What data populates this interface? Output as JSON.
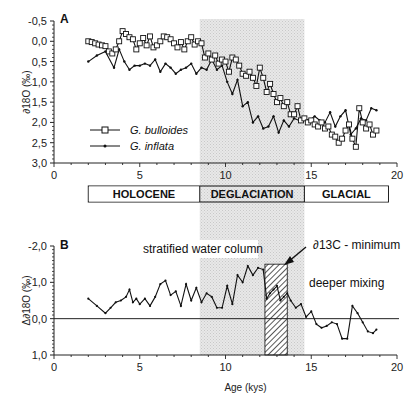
{
  "chart_data": [
    {
      "panel": "A",
      "type": "line",
      "title": "",
      "xlabel": "",
      "ylabel": "∂18O (‰)",
      "xlim": [
        0,
        20
      ],
      "ylim": [
        3.0,
        -0.5
      ],
      "y_inverted": true,
      "x_ticks": [
        "0",
        "5",
        "10",
        "15",
        "20"
      ],
      "y_ticks": [
        "-0,5",
        "0,0",
        "0,5",
        "1,0",
        "1,5",
        "2,0",
        "2,5",
        "3,0"
      ],
      "legend": {
        "position": "lower-left",
        "entries": [
          "G. bulloides",
          "G. inflata"
        ]
      },
      "shaded_region": {
        "x0": 8.5,
        "x1": 14.6,
        "label": "DEGLACIATION"
      },
      "series": [
        {
          "name": "G. bulloides",
          "marker": "open-square",
          "x": [
            2.0,
            2.2,
            2.4,
            2.6,
            2.8,
            3.0,
            3.2,
            3.4,
            3.6,
            3.8,
            4.0,
            4.2,
            4.4,
            4.6,
            4.8,
            5.0,
            5.2,
            5.4,
            5.6,
            5.8,
            6.0,
            6.2,
            6.4,
            6.6,
            6.8,
            7.0,
            7.2,
            7.4,
            7.6,
            7.8,
            8.0,
            8.2,
            8.4,
            8.6,
            8.8,
            9.0,
            9.2,
            9.4,
            9.6,
            9.8,
            10.0,
            10.2,
            10.4,
            10.6,
            10.8,
            11.0,
            11.2,
            11.4,
            11.6,
            11.8,
            12.0,
            12.2,
            12.4,
            12.6,
            12.8,
            13.0,
            13.2,
            13.4,
            13.6,
            13.8,
            14.0,
            14.2,
            14.4,
            14.6,
            14.8,
            15.0,
            15.2,
            15.4,
            15.6,
            15.8,
            16.0,
            16.2,
            16.4,
            16.6,
            16.8,
            17.0,
            17.2,
            17.4,
            17.6,
            17.8,
            18.0,
            18.2,
            18.4,
            18.6,
            18.8
          ],
          "y": [
            0.0,
            0.02,
            0.05,
            0.08,
            0.1,
            0.12,
            0.25,
            0.3,
            0.2,
            0.0,
            -0.25,
            -0.18,
            -0.1,
            -0.05,
            0.2,
            0.05,
            -0.08,
            0.1,
            -0.12,
            0.15,
            0.1,
            0.0,
            -0.12,
            -0.1,
            -0.05,
            0.05,
            0.15,
            0.02,
            0.2,
            0.0,
            -0.1,
            0.08,
            0.0,
            0.05,
            0.4,
            0.3,
            0.45,
            0.35,
            0.55,
            0.45,
            0.5,
            0.75,
            0.4,
            0.45,
            0.6,
            0.8,
            0.85,
            0.75,
            0.9,
            1.1,
            0.65,
            0.9,
            1.25,
            1.05,
            1.3,
            1.5,
            1.4,
            1.6,
            1.5,
            1.8,
            1.8,
            1.6,
            1.95,
            1.9,
            2.0,
            1.95,
            2.05,
            2.1,
            2.0,
            2.15,
            2.1,
            2.3,
            2.35,
            2.5,
            2.4,
            2.2,
            2.05,
            2.4,
            2.6,
            1.65,
            2.0,
            2.15,
            2.05,
            2.3,
            2.2
          ],
          "note": "values estimated from pixel positions"
        },
        {
          "name": "G. inflata",
          "marker": "small-dot",
          "x": [
            2.0,
            2.5,
            3.0,
            3.5,
            3.8,
            4.1,
            4.4,
            4.7,
            5.0,
            5.3,
            5.6,
            5.9,
            6.2,
            6.5,
            6.8,
            7.1,
            7.4,
            7.7,
            8.0,
            8.3,
            8.6,
            8.9,
            9.2,
            9.5,
            9.8,
            10.1,
            10.4,
            10.7,
            11.0,
            11.3,
            11.6,
            11.9,
            12.2,
            12.5,
            12.8,
            13.1,
            13.4,
            13.7,
            14.0,
            14.3,
            14.6,
            14.9,
            15.2,
            15.5,
            15.8,
            16.1,
            16.4,
            16.7,
            17.0,
            17.3,
            17.6,
            17.9,
            18.2,
            18.5,
            18.8
          ],
          "y": [
            0.5,
            0.35,
            0.25,
            0.65,
            0.2,
            0.5,
            0.7,
            0.6,
            0.6,
            0.55,
            0.6,
            0.45,
            0.75,
            0.55,
            0.65,
            0.8,
            0.7,
            0.65,
            0.55,
            0.8,
            0.65,
            0.7,
            0.45,
            0.7,
            0.6,
            1.0,
            1.3,
            0.95,
            1.6,
            1.5,
            2.0,
            1.85,
            2.15,
            2.1,
            1.85,
            2.25,
            1.95,
            2.1,
            1.9,
            1.95,
            1.9,
            1.95,
            1.85,
            1.95,
            2.0,
            1.75,
            2.1,
            1.85,
            1.7,
            2.3,
            2.15,
            1.9,
            1.95,
            1.65,
            1.7
          ]
        }
      ]
    },
    {
      "panel": "B",
      "type": "line",
      "title": "",
      "xlabel": "Age (kys)",
      "ylabel": "Δ∂18O (‰)",
      "xlim": [
        0,
        20
      ],
      "ylim": [
        1.0,
        -2.0
      ],
      "y_inverted": true,
      "x_ticks": [
        "0",
        "5",
        "10",
        "15",
        "20"
      ],
      "y_ticks": [
        "-2,0",
        "-1,0",
        "0,0",
        "1,0"
      ],
      "zero_line": 0.0,
      "shaded_region": {
        "x0": 8.5,
        "x1": 14.6
      },
      "hatched_region": {
        "x0": 12.3,
        "x1": 13.6,
        "ytop": -1.5,
        "label": "∂13C - minimum"
      },
      "annotations": [
        "stratified water column",
        "∂13C - minimum",
        "deeper mixing"
      ],
      "series": [
        {
          "name": "Δ∂18O",
          "x": [
            2.0,
            2.5,
            3.0,
            3.3,
            3.6,
            3.9,
            4.2,
            4.4,
            4.6,
            4.8,
            5.0,
            5.3,
            5.6,
            5.9,
            6.2,
            6.5,
            6.8,
            7.1,
            7.4,
            7.7,
            8.0,
            8.3,
            8.6,
            8.9,
            9.2,
            9.5,
            9.8,
            10.1,
            10.4,
            10.7,
            11.0,
            11.3,
            11.6,
            11.9,
            12.2,
            12.4,
            12.6,
            12.8,
            13.0,
            13.2,
            13.4,
            13.6,
            13.8,
            14.1,
            14.4,
            14.7,
            15.0,
            15.3,
            15.6,
            15.9,
            16.2,
            16.5,
            16.8,
            17.1,
            17.4,
            17.7,
            18.0,
            18.3,
            18.6,
            18.8
          ],
          "y": [
            -0.55,
            -0.35,
            -0.15,
            -0.3,
            -0.45,
            -0.5,
            -0.6,
            -0.8,
            -0.45,
            -0.55,
            -0.4,
            -0.55,
            -0.35,
            -0.6,
            -0.95,
            -1.05,
            -0.65,
            -0.75,
            -0.35,
            -0.95,
            -0.5,
            -0.85,
            -0.45,
            -0.7,
            -0.6,
            -0.3,
            -0.3,
            -0.9,
            -0.4,
            -1.2,
            -1.0,
            -1.45,
            -1.2,
            -1.4,
            -1.35,
            -0.55,
            -0.7,
            -0.8,
            -0.9,
            -0.5,
            -0.6,
            -0.7,
            -0.5,
            -0.3,
            -0.4,
            -0.05,
            -0.2,
            0.15,
            0.25,
            0.2,
            0.1,
            0.15,
            0.55,
            0.55,
            -0.35,
            -0.15,
            0.1,
            0.35,
            0.4,
            0.3
          ]
        }
      ]
    }
  ],
  "panel_a": {
    "label": "A",
    "ylabel": "∂18O (‰)"
  },
  "panel_b": {
    "label": "B",
    "ylabel": "Δ∂18O (‰)",
    "xlabel": "Age (kys)"
  },
  "periods": [
    "HOLOCENE",
    "DEGLACIATION",
    "GLACIAL"
  ],
  "legend": {
    "bulloides": "G. bulloides",
    "inflata": "G. inflata"
  },
  "annotations": {
    "stratified": "stratified water column",
    "c13min": "∂13C - minimum",
    "deeper": "deeper mixing"
  }
}
